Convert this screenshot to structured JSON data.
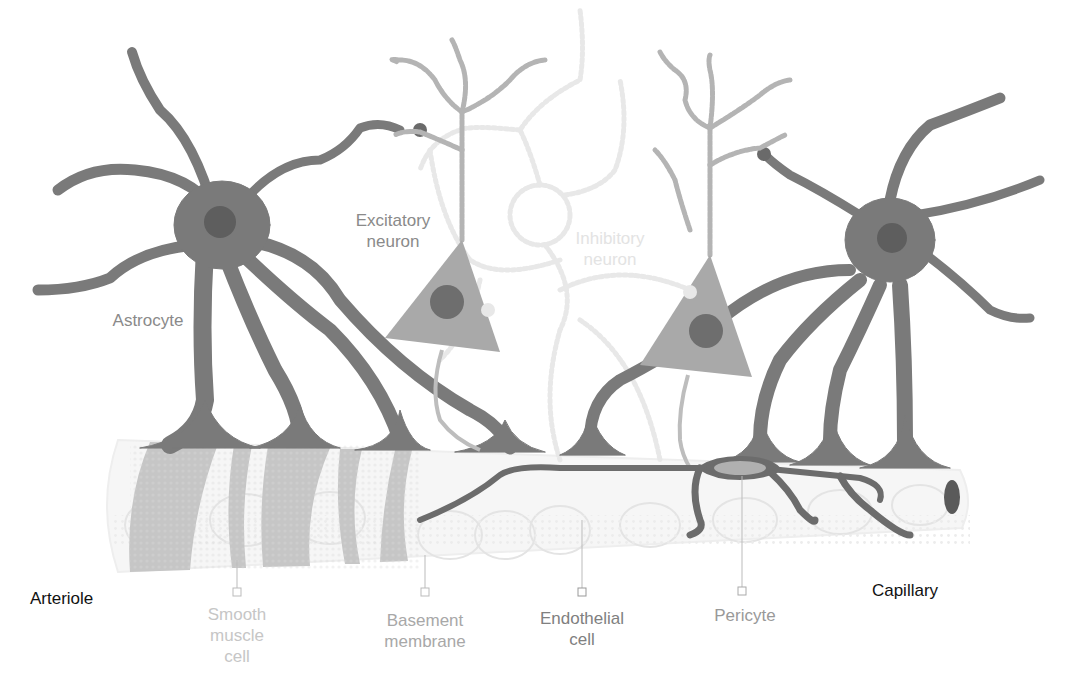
{
  "diagram": {
    "type": "neurovascular-unit-illustration",
    "colors": {
      "astrocyte": "#7a7a7a",
      "astrocyte_nucleus": "#5e5e5e",
      "neuron_body": "#a9a9a9",
      "neuron_nucleus": "#6e6e6e",
      "dendrite": "#b4b4b4",
      "inhibitory_neuron": "#e6e6e6",
      "smooth_muscle": "#c4c4c4",
      "endothelium": "#ececec",
      "pericyte": "#6c6c6c",
      "pericyte_nucleus": "#b0b0b0",
      "label_dark": "#111111",
      "label_mid": "#8a8a8a",
      "label_light": "#c6c6c6"
    }
  },
  "labels": {
    "astrocyte": "Astrocyte",
    "excitatory_neuron": "Excitatory\nneuron",
    "inhibitory_neuron": "Inhibitory\nneuron",
    "arteriole": "Arteriole",
    "capillary": "Capillary",
    "smooth_muscle_cell": "Smooth\nmuscle\ncell",
    "basement_membrane": "Basement\nmembrane",
    "endothelial_cell": "Endothelial\ncell",
    "pericyte": "Pericyte"
  }
}
